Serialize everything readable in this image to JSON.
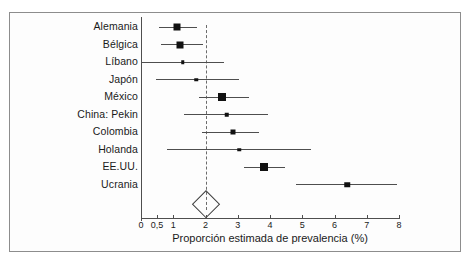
{
  "figure": {
    "x_axis_title": "Proporción estimada de prevalencia (%)",
    "tick_labels": [
      "0",
      "0,5",
      "1",
      "2",
      "3",
      "4",
      "5",
      "6",
      "7",
      "8"
    ],
    "study_labels": [
      "Alemania",
      "Bélgica",
      "Líbano",
      "Japón",
      "México",
      "China: Pekin",
      "Colombia",
      "Holanda",
      "EE.UU.",
      "Ucrania"
    ]
  },
  "chart_data": {
    "type": "forest",
    "title": "",
    "xlabel": "Proporción estimada de prevalencia (%)",
    "ylabel": "",
    "xlim": [
      0,
      8
    ],
    "xticks": [
      0,
      0.5,
      1,
      2,
      3,
      4,
      5,
      6,
      7,
      8
    ],
    "xtick_labels": [
      "0",
      "0,5",
      "1",
      "2",
      "3",
      "4",
      "5",
      "6",
      "7",
      "8"
    ],
    "grid": false,
    "legend": null,
    "reference_line": 2.0,
    "reference_line_style": "dashed",
    "categories": [
      "Alemania",
      "Bélgica",
      "Líbano",
      "Japón",
      "México",
      "China: Pekin",
      "Colombia",
      "Holanda",
      "EE.UU.",
      "Ucrania"
    ],
    "values": [
      1.13,
      1.2,
      1.3,
      1.72,
      2.52,
      2.66,
      2.84,
      3.04,
      3.82,
      6.4
    ],
    "ci_low": [
      0.57,
      0.62,
      0.0,
      0.47,
      1.8,
      1.33,
      1.9,
      0.82,
      3.19,
      4.81
    ],
    "ci_high": [
      1.73,
      1.93,
      2.58,
      3.04,
      3.36,
      3.95,
      3.67,
      5.27,
      4.47,
      7.93
    ],
    "marker_sizes": [
      7,
      7,
      3.5,
      3.5,
      8,
      4.5,
      5,
      3.5,
      8,
      5.5
    ],
    "summary": {
      "label": "",
      "value": 2.0,
      "ci_low": 1.62,
      "ci_high": 2.4,
      "shape": "diamond"
    }
  }
}
